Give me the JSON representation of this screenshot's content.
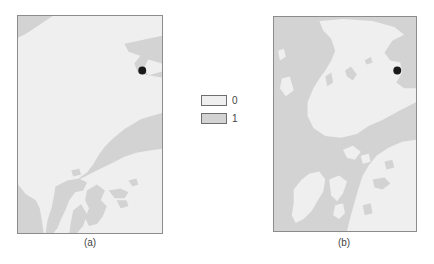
{
  "figure": {
    "panels": [
      {
        "id": "a",
        "caption": "(a)",
        "marker": {
          "x_px": 126,
          "y_px": 55
        }
      },
      {
        "id": "b",
        "caption": "(b)",
        "marker": {
          "x_px": 125,
          "y_px": 54
        }
      }
    ],
    "legend": {
      "items": [
        {
          "label": "0",
          "color": "#efefef"
        },
        {
          "label": "1",
          "color": "#d3d3d3"
        }
      ]
    },
    "colors": {
      "class_0": "#efefef",
      "class_1": "#d3d3d3",
      "border": "#8c8c8c",
      "marker": "#1a1a1a"
    }
  }
}
